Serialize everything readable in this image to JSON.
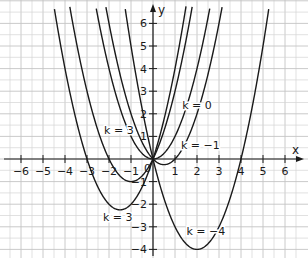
{
  "chart_data": {
    "type": "line",
    "title": "",
    "function_family": "y = x^2 + kx",
    "xlabel": "x",
    "ylabel": "y",
    "xlim": [
      -6.9,
      6.9
    ],
    "ylim": [
      -4.4,
      7.1
    ],
    "grid": true,
    "grid_minor_step": 0.5,
    "x_ticks": [
      -6,
      -5,
      -4,
      -3,
      -2,
      -1,
      1,
      2,
      3,
      4,
      5,
      6
    ],
    "x_tick_labels": [
      "−6",
      "−5",
      "−4",
      "−3",
      "−2",
      "−1",
      "1",
      "2",
      "3",
      "4",
      "5",
      "6"
    ],
    "y_ticks": [
      -4,
      -3,
      -2,
      -1,
      1,
      2,
      3,
      4,
      5,
      6
    ],
    "y_tick_labels": [
      "−4",
      "−3",
      "−2",
      "−1",
      "1",
      "2",
      "3",
      "4",
      "5",
      "6"
    ],
    "origin_label": "0",
    "series": [
      {
        "name": "k = 3",
        "k": 3,
        "vertex": [
          -1.5,
          -2.25
        ],
        "roots": [
          -3,
          0
        ]
      },
      {
        "name": "k = 2",
        "k": 2,
        "vertex": [
          -1,
          -1
        ],
        "roots": [
          -2,
          0
        ]
      },
      {
        "name": "k = 0",
        "k": 0,
        "vertex": [
          0,
          0
        ],
        "roots": [
          0
        ]
      },
      {
        "name": "k = −1",
        "k": -1,
        "vertex": [
          0.5,
          -0.25
        ],
        "roots": [
          0,
          1
        ]
      },
      {
        "name": "k = −4",
        "k": -4,
        "vertex": [
          2,
          -4
        ],
        "roots": [
          0,
          4
        ]
      }
    ],
    "annotations": [
      {
        "text": "k = 3",
        "x": -1.55,
        "y": 1.1
      },
      {
        "text": "k = 0",
        "x": 2.0,
        "y": 2.2
      },
      {
        "text": "k = −1",
        "x": 2.15,
        "y": 0.45
      },
      {
        "text": "k = 3",
        "x": -1.6,
        "y": -2.75
      },
      {
        "text": "k = −4",
        "x": 2.4,
        "y": -3.35
      }
    ]
  }
}
